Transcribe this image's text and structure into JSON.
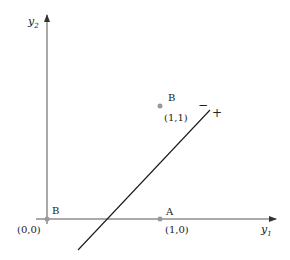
{
  "diagram": {
    "type": "xor-decision-boundary",
    "axes": {
      "x_label": "y",
      "x_label_sub": "1",
      "y_label": "y",
      "y_label_sub": "2"
    },
    "points": [
      {
        "name": "B",
        "coords": "(0,0)",
        "x": 0,
        "y": 0
      },
      {
        "name": "A",
        "coords": "(1,0)",
        "x": 1,
        "y": 0
      },
      {
        "name": "B",
        "coords": "(1,1)",
        "x": 1,
        "y": 1
      }
    ],
    "boundary": {
      "minus_label": "−",
      "plus_label": "+"
    },
    "colors": {
      "axis": "#555555",
      "line": "#1a1a1a",
      "point": "#999999",
      "text": "#222222"
    }
  }
}
